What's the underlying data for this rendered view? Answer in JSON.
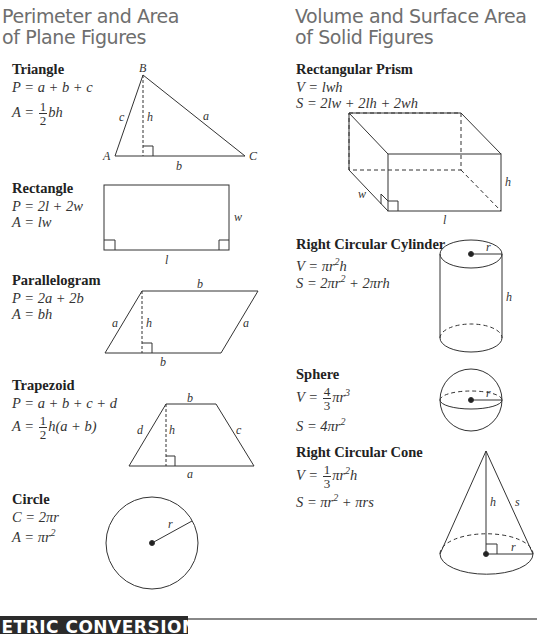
{
  "left_section": {
    "title_line1": "Perimeter and Area",
    "title_line2": "of Plane Figures",
    "figures": [
      {
        "name": "Triangle",
        "perimeter": "P = a + b + c",
        "area_prefix": "A = ",
        "area_frac_num": "1",
        "area_frac_den": "2",
        "area_suffix": "bh",
        "labels": {
          "vertex_a": "A",
          "vertex_b": "B",
          "vertex_c": "C",
          "side_a": "a",
          "side_b": "b",
          "side_c": "c",
          "height": "h"
        }
      },
      {
        "name": "Rectangle",
        "perimeter": "P = 2l + 2w",
        "area": "A = lw",
        "labels": {
          "width": "w",
          "length": "l"
        }
      },
      {
        "name": "Parallelogram",
        "perimeter": "P = 2a + 2b",
        "area": "A = bh",
        "labels": {
          "top": "b",
          "bottom": "b",
          "left": "a",
          "right": "a",
          "height": "h"
        }
      },
      {
        "name": "Trapezoid",
        "perimeter": "P = a + b + c + d",
        "area_prefix": "A = ",
        "area_frac_num": "1",
        "area_frac_den": "2",
        "area_suffix": "h(a + b)",
        "labels": {
          "top": "b",
          "bottom": "a",
          "left": "d",
          "right": "c",
          "height": "h"
        }
      },
      {
        "name": "Circle",
        "circumference": "C = 2πr",
        "area_prefix": "A = πr",
        "area_sup": "2",
        "labels": {
          "radius": "r"
        }
      }
    ]
  },
  "right_section": {
    "title_line1": "Volume and Surface Area",
    "title_line2": "of Solid Figures",
    "figures": [
      {
        "name": "Rectangular Prism",
        "volume": "V = lwh",
        "surface": "S = 2lw + 2lh + 2wh",
        "labels": {
          "width": "w",
          "length": "l",
          "height": "h"
        }
      },
      {
        "name": "Right Circular Cylinder",
        "volume_prefix": "V = πr",
        "volume_sup": "2",
        "volume_suffix": "h",
        "surface_prefix": "S = 2πr",
        "surface_sup": "2",
        "surface_suffix": " + 2πrh",
        "labels": {
          "radius": "r",
          "height": "h"
        }
      },
      {
        "name": "Sphere",
        "volume_prefix": "V = ",
        "volume_frac_num": "4",
        "volume_frac_den": "3",
        "volume_suffix": "πr",
        "volume_sup": "3",
        "surface_prefix": "S = 4πr",
        "surface_sup": "2",
        "labels": {
          "radius": "r"
        }
      },
      {
        "name": "Right Circular Cone",
        "volume_prefix": "V = ",
        "volume_frac_num": "1",
        "volume_frac_den": "3",
        "volume_suffix": "πr",
        "volume_sup": "2",
        "volume_tail": "h",
        "surface_prefix": "S = πr",
        "surface_sup": "2",
        "surface_suffix": " + πrs",
        "labels": {
          "height": "h",
          "slant": "s",
          "radius": "r"
        }
      }
    ]
  },
  "footer": {
    "banner_text": "METRIC CONVERSIONS"
  }
}
